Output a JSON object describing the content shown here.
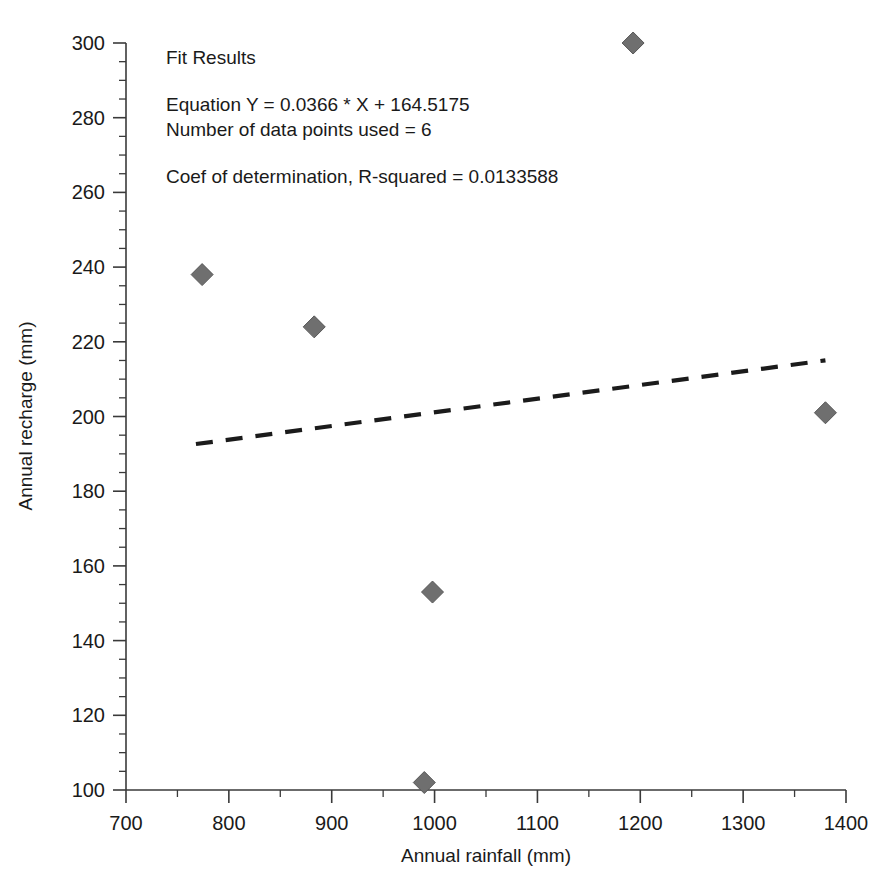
{
  "chart_data": {
    "type": "scatter",
    "title": "",
    "xlabel": "Annual rainfall (mm)",
    "ylabel": "Annual recharge (mm)",
    "xlim": [
      700,
      1400
    ],
    "ylim": [
      100,
      300
    ],
    "x_ticks": [
      700,
      800,
      900,
      1000,
      1100,
      1200,
      1300,
      1400
    ],
    "y_ticks": [
      100,
      120,
      140,
      160,
      180,
      200,
      220,
      240,
      260,
      280,
      300
    ],
    "x_minor_step": 50,
    "y_minor_step": 5,
    "grid": false,
    "legend": null,
    "marker_style": "diamond",
    "marker_color": "#6f6f6f",
    "points": [
      {
        "x": 774,
        "y": 238
      },
      {
        "x": 883,
        "y": 224
      },
      {
        "x": 990,
        "y": 102
      },
      {
        "x": 998,
        "y": 153
      },
      {
        "x": 1193,
        "y": 300
      },
      {
        "x": 1380,
        "y": 201
      }
    ],
    "series": [
      {
        "name": "Annual recharge vs rainfall",
        "x": [
          774,
          883,
          990,
          998,
          1193,
          1380
        ],
        "values": [
          238,
          224,
          102,
          153,
          300,
          201
        ]
      }
    ],
    "fit_line": {
      "style": "dashed",
      "color": "#1b1b1b",
      "slope": 0.0366,
      "intercept": 164.5175,
      "x_start": 768,
      "x_end": 1380
    },
    "annotations": {
      "heading": "Fit Results",
      "equation": "Equation Y = 0.0366 * X + 164.5175",
      "points_used": "Number of data points used = 6",
      "r_squared": "Coef of determination, R-squared = 0.0133588"
    }
  }
}
